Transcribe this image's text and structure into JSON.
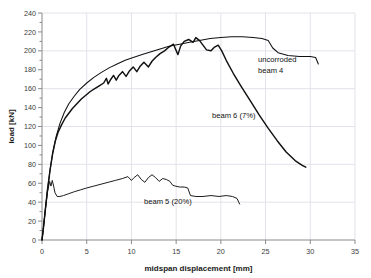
{
  "chart_data": {
    "type": "line",
    "title": "",
    "xlabel": "midspan displacement [mm]",
    "ylabel": "load [kN]",
    "xlim": [
      0,
      35
    ],
    "ylim": [
      0,
      240
    ],
    "xticks": [
      0,
      5,
      10,
      15,
      20,
      25,
      30,
      35
    ],
    "yticks": [
      0,
      20,
      40,
      60,
      80,
      100,
      120,
      140,
      160,
      180,
      200,
      220,
      240
    ],
    "yminor_step": 10,
    "grid": "faint horizontal and vertical gridlines",
    "legend": "inline annotations on curves",
    "series": [
      {
        "name": "uncorroded beam 4",
        "label": "uncorroded\nbeam 4",
        "color": "#111111",
        "points": [
          [
            0.0,
            0
          ],
          [
            0.15,
            12
          ],
          [
            0.35,
            30
          ],
          [
            0.6,
            52
          ],
          [
            0.9,
            74
          ],
          [
            1.2,
            92
          ],
          [
            1.6,
            110
          ],
          [
            2.0,
            123
          ],
          [
            2.5,
            135
          ],
          [
            3.0,
            144
          ],
          [
            3.6,
            152
          ],
          [
            4.2,
            159
          ],
          [
            5.0,
            166
          ],
          [
            5.8,
            172
          ],
          [
            6.6,
            177
          ],
          [
            7.5,
            182
          ],
          [
            8.4,
            186
          ],
          [
            9.3,
            190
          ],
          [
            10.2,
            193
          ],
          [
            11.2,
            196
          ],
          [
            12.2,
            199
          ],
          [
            13.2,
            202
          ],
          [
            14.3,
            205
          ],
          [
            15.4,
            207
          ],
          [
            16.5,
            209
          ],
          [
            17.6,
            211
          ],
          [
            18.8,
            213
          ],
          [
            20.0,
            214
          ],
          [
            21.2,
            215
          ],
          [
            22.4,
            215
          ],
          [
            23.6,
            214
          ],
          [
            24.6,
            213
          ],
          [
            25.3,
            211
          ],
          [
            25.8,
            203
          ],
          [
            26.4,
            198
          ],
          [
            27.5,
            195
          ],
          [
            28.8,
            194
          ],
          [
            30.0,
            194
          ],
          [
            30.6,
            193
          ],
          [
            30.9,
            186
          ]
        ]
      },
      {
        "name": "beam 6 (7%)",
        "label": "beam 6 (7%)",
        "color": "#111111",
        "points": [
          [
            0.0,
            0
          ],
          [
            0.15,
            12
          ],
          [
            0.35,
            30
          ],
          [
            0.6,
            52
          ],
          [
            0.9,
            74
          ],
          [
            1.2,
            92
          ],
          [
            1.5,
            105
          ],
          [
            1.8,
            114
          ],
          [
            2.2,
            122
          ],
          [
            2.6,
            129
          ],
          [
            3.0,
            134
          ],
          [
            3.4,
            139
          ],
          [
            3.9,
            144
          ],
          [
            4.4,
            149
          ],
          [
            4.9,
            153
          ],
          [
            5.4,
            157
          ],
          [
            5.9,
            160
          ],
          [
            6.4,
            163
          ],
          [
            6.9,
            166
          ],
          [
            7.2,
            171
          ],
          [
            7.4,
            165
          ],
          [
            7.7,
            170
          ],
          [
            8.0,
            174
          ],
          [
            8.3,
            169
          ],
          [
            8.6,
            174
          ],
          [
            9.0,
            178
          ],
          [
            9.4,
            173
          ],
          [
            9.8,
            179
          ],
          [
            10.2,
            183
          ],
          [
            10.6,
            178
          ],
          [
            11.0,
            184
          ],
          [
            11.4,
            188
          ],
          [
            11.9,
            183
          ],
          [
            12.3,
            189
          ],
          [
            12.7,
            193
          ],
          [
            13.2,
            197
          ],
          [
            13.7,
            200
          ],
          [
            14.2,
            204
          ],
          [
            14.7,
            207
          ],
          [
            15.2,
            196
          ],
          [
            15.5,
            205
          ],
          [
            15.9,
            210
          ],
          [
            16.4,
            212
          ],
          [
            16.9,
            209
          ],
          [
            17.2,
            214
          ],
          [
            17.6,
            211
          ],
          [
            18.0,
            206
          ],
          [
            18.4,
            201
          ],
          [
            18.9,
            200
          ],
          [
            19.3,
            204
          ],
          [
            19.7,
            206
          ],
          [
            20.1,
            200
          ],
          [
            20.6,
            190
          ],
          [
            21.4,
            176
          ],
          [
            22.3,
            162
          ],
          [
            23.3,
            147
          ],
          [
            24.3,
            132
          ],
          [
            25.3,
            118
          ],
          [
            26.3,
            105
          ],
          [
            27.3,
            93
          ],
          [
            28.3,
            84
          ],
          [
            29.1,
            79
          ],
          [
            29.5,
            77
          ]
        ]
      },
      {
        "name": "beam 5 (20%)",
        "label": "beam 5 (20%)",
        "color": "#111111",
        "points": [
          [
            0.0,
            0
          ],
          [
            0.15,
            12
          ],
          [
            0.35,
            30
          ],
          [
            0.6,
            50
          ],
          [
            0.85,
            62
          ],
          [
            1.0,
            57
          ],
          [
            1.15,
            63
          ],
          [
            1.3,
            57
          ],
          [
            1.45,
            50
          ],
          [
            1.7,
            46
          ],
          [
            2.0,
            46
          ],
          [
            2.4,
            47
          ],
          [
            3.0,
            49
          ],
          [
            3.6,
            51
          ],
          [
            4.3,
            53
          ],
          [
            5.0,
            55
          ],
          [
            5.8,
            57
          ],
          [
            6.6,
            59
          ],
          [
            7.4,
            61
          ],
          [
            8.2,
            63
          ],
          [
            9.0,
            65
          ],
          [
            9.6,
            67
          ],
          [
            10.0,
            63
          ],
          [
            10.3,
            66
          ],
          [
            10.7,
            69
          ],
          [
            11.1,
            64
          ],
          [
            11.5,
            61
          ],
          [
            11.9,
            66
          ],
          [
            12.3,
            69
          ],
          [
            12.7,
            66
          ],
          [
            13.1,
            62
          ],
          [
            13.5,
            65
          ],
          [
            13.9,
            64
          ],
          [
            14.3,
            62
          ],
          [
            14.6,
            58
          ],
          [
            14.9,
            57
          ],
          [
            15.4,
            56
          ],
          [
            15.9,
            56
          ],
          [
            16.3,
            55
          ],
          [
            16.6,
            47
          ],
          [
            17.2,
            46
          ],
          [
            18.0,
            46
          ],
          [
            18.9,
            47
          ],
          [
            19.8,
            46
          ],
          [
            20.6,
            47
          ],
          [
            21.3,
            46
          ],
          [
            21.8,
            44
          ],
          [
            22.1,
            38
          ]
        ]
      }
    ],
    "annotations": [
      {
        "name": "uncorroded-beam-4-label",
        "line1": "uncorroded",
        "line2": "beam 4",
        "x_px": 258,
        "y_px": 62
      },
      {
        "name": "beam-6-label",
        "text": "beam 6 (7%)",
        "x_px": 212,
        "y_px": 118
      },
      {
        "name": "beam-5-label",
        "text": "beam 5 (20%)",
        "x_px": 144,
        "y_px": 204
      }
    ]
  },
  "colors": {
    "background": "#ffffff",
    "series": "#111111",
    "axis": "#8a8a8a",
    "grid": "#e2e2ea",
    "text": "#1a1a1a"
  }
}
